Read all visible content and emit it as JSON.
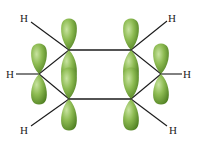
{
  "diagram": {
    "colors": {
      "lobe_light": "#a9cf7a",
      "lobe_mid": "#7fae45",
      "lobe_dark": "#4f7f22",
      "bond": "#1a1a1a",
      "label": "#222222"
    },
    "hydrogen_labels": {
      "top_left": "H",
      "top_right": "H",
      "left": "H",
      "right": "H",
      "bottom_left": "H",
      "bottom_right": "H"
    }
  }
}
